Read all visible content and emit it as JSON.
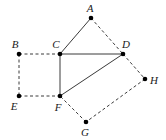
{
  "figure": {
    "width": 166,
    "height": 140,
    "background_color": "#ffffff",
    "stroke_color": "#3a3a3a",
    "vertex_color": "#000000",
    "label_color": "#1a1a1a",
    "vertex_radius": 2.3,
    "stroke_width": 1,
    "dash_pattern": "3,2.5"
  },
  "vertices": [
    {
      "id": "A",
      "label": "A",
      "x": 91,
      "y": 18,
      "label_x": 90,
      "label_y": 8
    },
    {
      "id": "B",
      "label": "B",
      "x": 19,
      "y": 54,
      "label_x": 15,
      "label_y": 44
    },
    {
      "id": "C",
      "label": "C",
      "x": 60,
      "y": 54,
      "label_x": 56,
      "label_y": 44
    },
    {
      "id": "D",
      "label": "D",
      "x": 123,
      "y": 54,
      "label_x": 126,
      "label_y": 44
    },
    {
      "id": "E",
      "label": "E",
      "x": 19,
      "y": 96,
      "label_x": 14,
      "label_y": 106
    },
    {
      "id": "F",
      "label": "F",
      "x": 60,
      "y": 96,
      "label_x": 58,
      "label_y": 107
    },
    {
      "id": "G",
      "label": "G",
      "x": 86,
      "y": 122,
      "label_x": 85,
      "label_y": 132
    },
    {
      "id": "H",
      "label": "H",
      "x": 145,
      "y": 79,
      "label_x": 154,
      "label_y": 80
    }
  ],
  "edges": [
    {
      "id": "A-C",
      "from": "A",
      "to": "C",
      "style": "solid"
    },
    {
      "id": "A-D",
      "from": "A",
      "to": "D",
      "style": "dashed"
    },
    {
      "id": "C-D",
      "from": "C",
      "to": "D",
      "style": "solid"
    },
    {
      "id": "C-F",
      "from": "C",
      "to": "F",
      "style": "solid"
    },
    {
      "id": "F-D",
      "from": "F",
      "to": "D",
      "style": "solid"
    },
    {
      "id": "B-C",
      "from": "B",
      "to": "C",
      "style": "dashed"
    },
    {
      "id": "B-E",
      "from": "B",
      "to": "E",
      "style": "dashed"
    },
    {
      "id": "E-F",
      "from": "E",
      "to": "F",
      "style": "dashed"
    },
    {
      "id": "D-H",
      "from": "D",
      "to": "H",
      "style": "dashed"
    },
    {
      "id": "H-G",
      "from": "H",
      "to": "G",
      "style": "dashed"
    },
    {
      "id": "G-F",
      "from": "G",
      "to": "F",
      "style": "dashed"
    }
  ]
}
